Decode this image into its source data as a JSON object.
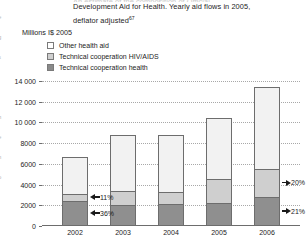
{
  "title": {
    "clipped_line": "An estimate of the composition of Official",
    "line1": "Development Aid for Health. Yearly aid flows in 2005,",
    "line2": "deflator adjusted",
    "footnote_marker": "67"
  },
  "units_label": "Millions I$ 2005",
  "legend": {
    "position": "top-left",
    "items": [
      {
        "label": "Other health aid",
        "color": "#f2f2f2",
        "key": "other"
      },
      {
        "label": "Technical cooperation HIV/AIDS",
        "color": "#cfcfcf",
        "key": "hiv"
      },
      {
        "label": "Technical cooperation health",
        "color": "#8f8f8f",
        "key": "health"
      }
    ]
  },
  "ghost_fragments": [
    "e",
    "g",
    "s",
    "i",
    "t",
    "h",
    "e",
    "n",
    "o",
    "f"
  ],
  "chart_data": {
    "type": "bar",
    "subtype": "stacked-vertical",
    "title": "An estimate of the composition of Official Development Aid for Health. Yearly aid flows in 2005, deflator adjusted",
    "xlabel": "",
    "ylabel": "Millions I$ 2005",
    "categories": [
      "2002",
      "2003",
      "2004",
      "2005",
      "2006"
    ],
    "ylim": [
      0,
      14000
    ],
    "yticks": [
      0,
      2000,
      4000,
      6000,
      8000,
      10000,
      12000,
      14000
    ],
    "ytick_labels": [
      "0",
      "2000",
      "4000",
      "6000",
      "8000",
      "10 000",
      "12 000",
      "14 000"
    ],
    "grid": true,
    "grid_style": "dotted-horizontal",
    "legend_position": "above-plot-left",
    "series": [
      {
        "name": "Technical cooperation health",
        "color": "#8f8f8f",
        "values": [
          2400,
          2000,
          2100,
          2200,
          2800
        ]
      },
      {
        "name": "Technical cooperation HIV/AIDS",
        "color": "#cfcfcf",
        "values": [
          700,
          1400,
          1200,
          2300,
          2700
        ]
      },
      {
        "name": "Other health aid",
        "color": "#f2f2f2",
        "values": [
          3600,
          5400,
          5500,
          5900,
          7900
        ]
      }
    ],
    "totals": [
      6700,
      8800,
      8800,
      10400,
      13400
    ],
    "annotations": [
      {
        "text": "11%",
        "category": "2002",
        "series": "Technical cooperation HIV/AIDS",
        "arrow": "left"
      },
      {
        "text": "36%",
        "category": "2002",
        "series": "Technical cooperation health",
        "arrow": "left"
      },
      {
        "text": "20%",
        "category": "2006",
        "series": "Technical cooperation HIV/AIDS",
        "arrow": "right"
      },
      {
        "text": "21%",
        "category": "2006",
        "series": "Technical cooperation health",
        "arrow": "right"
      }
    ]
  }
}
